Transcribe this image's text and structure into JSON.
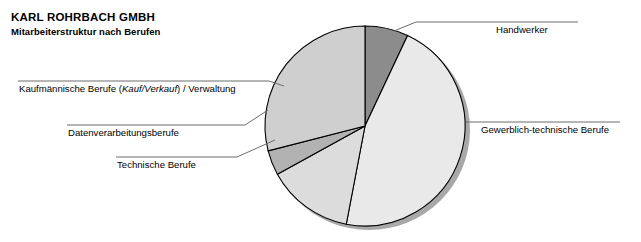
{
  "header": {
    "company": "KARL ROHRBACH GMBH",
    "subtitle": "Mitarbeiterstruktur nach Berufen"
  },
  "labels": {
    "handwerker": "Handwerker",
    "gewerblich": "Gewerblich-technische Berufe",
    "kaufmaennisch_pre": "Kaufmännische Berufe (",
    "kaufmaennisch_ital": "Kauf/Verkauf",
    "kaufmaennisch_post": ") / Verwaltung",
    "datenverarbeitung": "Datenverarbeitungsberufe",
    "technische": "Technische Berufe"
  },
  "chart_data": {
    "type": "pie",
    "title": "Mitarbeiterstruktur nach Berufen",
    "subtitle": "KARL ROHRBACH GMBH",
    "xlabel": "",
    "ylabel": "",
    "legend_position": "callout-labels",
    "grid": false,
    "categories": [
      "Handwerker",
      "Gewerblich-technische Berufe",
      "Technische Berufe",
      "Datenverarbeitungsberufe",
      "Kaufmännische Berufe (Kauf/Verkauf) / Verwaltung"
    ],
    "values": [
      7,
      46,
      14,
      4,
      29
    ],
    "colors": [
      "#8c8c8c",
      "#e9e9e9",
      "#dcdcdc",
      "#b2b2b2",
      "#cfcfcf"
    ],
    "start_angle_deg": 0,
    "direction": "clockwise",
    "style": "3d-shadow",
    "slices": [
      {
        "label": "Handwerker",
        "value": 7,
        "color": "#8c8c8c",
        "start_deg": 0,
        "end_deg": 25
      },
      {
        "label": "Gewerblich-technische Berufe",
        "value": 46,
        "color": "#e9e9e9",
        "start_deg": 25,
        "end_deg": 191
      },
      {
        "label": "Technische Berufe",
        "value": 14,
        "color": "#dcdcdc",
        "start_deg": 191,
        "end_deg": 241
      },
      {
        "label": "Datenverarbeitungsberufe",
        "value": 4,
        "color": "#b2b2b2",
        "start_deg": 241,
        "end_deg": 256
      },
      {
        "label": "Kaufmännische Berufe (Kauf/Verkauf) / Verwaltung",
        "value": 29,
        "color": "#cfcfcf",
        "start_deg": 256,
        "end_deg": 360
      }
    ]
  }
}
